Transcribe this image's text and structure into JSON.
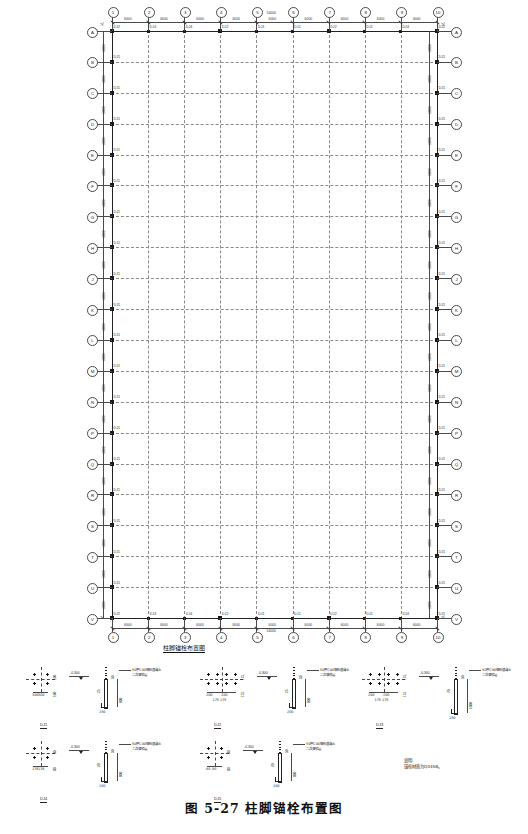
{
  "drawing": {
    "caption": "图 5-27  柱脚锚栓布置图",
    "plan_title": "柱脚锚栓布置图",
    "sheet_bg": "#ffffff",
    "line_color": "#4a4a4a"
  },
  "plan": {
    "column_grids": [
      "1",
      "2",
      "3",
      "4",
      "5",
      "6",
      "7",
      "8",
      "9",
      "10"
    ],
    "column_spacings": [
      "6000",
      "6000",
      "6000",
      "6000",
      "6000",
      "6000",
      "6000",
      "6000",
      "6000"
    ],
    "column_total": "54000",
    "column_total_top": "54000",
    "row_grids": [
      "A",
      "B",
      "C",
      "D",
      "E",
      "F",
      "G",
      "H",
      "J",
      "K",
      "L",
      "M",
      "N",
      "P",
      "Q",
      "R",
      "S",
      "T",
      "U",
      "V"
    ],
    "row_spacings": [
      "6000",
      "6000",
      "6000",
      "6000",
      "6000",
      "6000",
      "6000",
      "6000",
      "6000",
      "6000",
      "6000",
      "6000",
      "6000",
      "6000",
      "6000",
      "6000",
      "6000",
      "6000",
      "6000"
    ],
    "row_total": "114000",
    "column_marks": {
      "corner": "DJ2",
      "edge": "DJ4",
      "perimeter": "DJ1",
      "interior": "DJ3",
      "special": "DJ5"
    },
    "tag_row_top": [
      "DJ1",
      "DJ4",
      "DJ4",
      "DJ2",
      "DJ1",
      "DJ1",
      "DJ2",
      "DJ1",
      "DJ4",
      "DJ1"
    ],
    "tag_row_generic": [
      "DJ1",
      "DJ4",
      "DJ4",
      "DJ2",
      "DJ1",
      "DJ1",
      "DJ2",
      "DJ1",
      "DJ4",
      "DJ1"
    ]
  },
  "details": [
    {
      "id": "d1",
      "title": "DJ1",
      "plate_dims": [
        "300",
        "300"
      ],
      "side_dims": [
        "100",
        "100"
      ],
      "level": "-0.300",
      "embed_note": "50厚C40细石混凝土\n二次灌浆层",
      "rod_dims": [
        "50",
        "25"
      ],
      "rod_length": "800",
      "hook": "150",
      "bolt_rows": 2,
      "bolt_cols": 2
    },
    {
      "id": "d2",
      "title": "DJ2",
      "plate_dims": [
        "200",
        "200"
      ],
      "side_dims": [
        "175",
        "175"
      ],
      "level": "-0.300",
      "embed_note": "50厚C40细石混凝土\n二次灌浆层",
      "rod_dims": [
        "50",
        "25"
      ],
      "rod_length": "800",
      "hook": "200",
      "bolt_rows": 2,
      "bolt_cols": 4
    },
    {
      "id": "d3",
      "title": "DJ3",
      "plate_dims": [
        "200",
        "200"
      ],
      "side_dims": [
        "175",
        "175"
      ],
      "level": "-0.300",
      "embed_note": "50厚C40细石混凝土\n二次灌浆层",
      "rod_dims": [
        "50",
        "70"
      ],
      "rod_length": "1000",
      "hook": "150",
      "bolt_rows": 2,
      "bolt_cols": 4
    },
    {
      "id": "d4",
      "title": "DJ4",
      "plate_dims": [
        "135",
        "135"
      ],
      "side_dims": [
        "80",
        "80"
      ],
      "level": "-0.300",
      "embed_note": "50厚C40细石混凝土\n二次灌浆层",
      "rod_dims": [
        "50",
        "20"
      ],
      "rod_length": "800",
      "hook": "100",
      "bolt_rows": 2,
      "bolt_cols": 2
    },
    {
      "id": "d5",
      "title": "DJ5",
      "plate_dims": [
        "80",
        "80"
      ],
      "side_dims": [
        "80",
        "80"
      ],
      "level": "-0.300",
      "embed_note": "50厚C40细石混凝土\n二次灌浆层",
      "rod_dims": [
        "50",
        "20"
      ],
      "rod_length": "800",
      "hook": "100",
      "bolt_rows": 2,
      "bolt_cols": 2
    }
  ],
  "notes": {
    "heading": "说明:",
    "line1": "锚栓材质为Q345B。"
  }
}
